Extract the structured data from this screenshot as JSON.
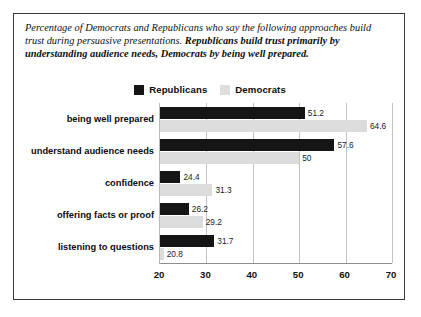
{
  "caption": {
    "plain": "Percentage of Democrats and Republicans who say the following approaches build trust during persuasive presentations. ",
    "bold": "Republicans build trust primarily by understanding audience needs, Democrats by being well prepared."
  },
  "legend": {
    "republicans_label": "Republicans",
    "democrats_label": "Democrats",
    "republicans_color": "#151515",
    "democrats_color": "#dcdcdc"
  },
  "chart_data": {
    "type": "bar",
    "orientation": "horizontal",
    "title": "",
    "xlabel": "",
    "ylabel": "",
    "xlim": [
      20,
      70
    ],
    "xticks": [
      20,
      30,
      40,
      50,
      60,
      70
    ],
    "grid": true,
    "legend_position": "top-center",
    "categories": [
      "being well prepared",
      "understand audience needs",
      "confidence",
      "offering facts or proof",
      "listening to questions"
    ],
    "series": [
      {
        "name": "Republicans",
        "color": "#151515",
        "values": [
          51.2,
          57.6,
          24.4,
          26.2,
          31.7
        ]
      },
      {
        "name": "Democrats",
        "color": "#dcdcdc",
        "values": [
          64.6,
          50,
          31.3,
          29.2,
          20.8
        ]
      }
    ],
    "value_labels": [
      [
        "51.2",
        "64.6"
      ],
      [
        "57.6",
        "50"
      ],
      [
        "24.4",
        "31.3"
      ],
      [
        "26.2",
        "29.2"
      ],
      [
        "31.7",
        "20.8"
      ]
    ]
  }
}
